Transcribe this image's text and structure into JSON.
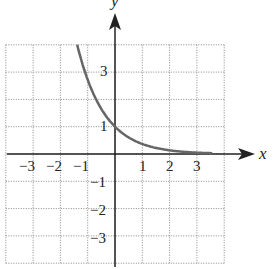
{
  "chart_data": {
    "type": "line",
    "title": "",
    "xlabel": "x",
    "ylabel": "y",
    "xlim": [
      -4,
      4
    ],
    "ylim": [
      -4,
      4
    ],
    "grid": true,
    "grid_style": "dotted",
    "x_ticks": [
      "-3",
      "-2",
      "-1",
      "1",
      "2",
      "3"
    ],
    "y_ticks": [
      "3",
      "1",
      "-1",
      "-2",
      "-3"
    ],
    "series": [
      {
        "name": "y = e^(-x)",
        "color": "#666666",
        "x": [
          -1.386,
          -1,
          -0.5,
          0,
          0.5,
          1,
          1.5,
          2,
          2.5,
          3,
          3.5
        ],
        "y": [
          4.0,
          2.718,
          1.649,
          1.0,
          0.607,
          0.368,
          0.223,
          0.135,
          0.082,
          0.05,
          0.03
        ]
      }
    ]
  },
  "labels": {
    "x_axis": "x",
    "y_axis": "y",
    "xt": [
      "−3",
      "−2",
      "−1",
      "1",
      "2",
      "3"
    ],
    "yt": [
      "3",
      "1",
      "−1",
      "−2",
      "−3"
    ]
  }
}
